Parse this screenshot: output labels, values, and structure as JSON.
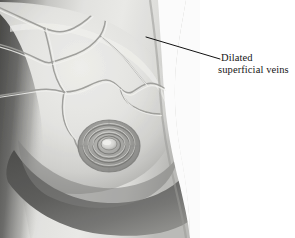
{
  "figure": {
    "name": "breast-dilated-superficial-veins",
    "type": "medical-photograph",
    "background_color": "#ffffff",
    "photo": {
      "skin_highlight_color": "#ececea",
      "skin_base_color": "#d9d9d6",
      "skin_midtone_color": "#bdbdba",
      "shadow_color": "#6e6e6e",
      "deep_shadow_color": "#4f4f4f",
      "areola_color": "#8f8f8c",
      "vein_color": "#a6a6a3",
      "panel_width": 200,
      "panel_height": 238
    },
    "annotations": [
      {
        "id": "dilated-superficial-veins",
        "line_1": "Dilated",
        "line_2": "superficial veins",
        "text_color": "#161616",
        "leader_line": {
          "color": "#111111",
          "width": 1,
          "from_x": 146,
          "from_y": 37,
          "to_x": 220,
          "to_y": 59
        }
      }
    ]
  }
}
